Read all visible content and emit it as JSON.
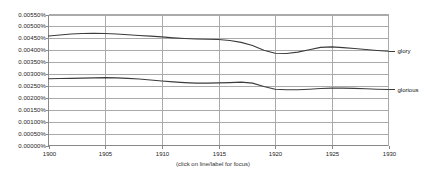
{
  "caption": "(click on line/label for focus)",
  "axes": {
    "y_ticks": [
      "0.00000%",
      "0.00050%",
      "0.00100%",
      "0.00150%",
      "0.00200%",
      "0.00250%",
      "0.00300%",
      "0.00350%",
      "0.00400%",
      "0.00450%",
      "0.00500%",
      "0.00550%"
    ],
    "x_ticks": [
      "1900",
      "1905",
      "1910",
      "1915",
      "1920",
      "1925",
      "1930"
    ],
    "ylim": [
      0,
      0.0055
    ],
    "xlim": [
      1900,
      1930
    ]
  },
  "colors": {
    "line": "#3c3c3c",
    "grid": "#aaaaaa",
    "axis": "#888888",
    "text": "#222222",
    "background": "#ffffff"
  },
  "chart_data": {
    "type": "line",
    "title": "",
    "xlabel": "",
    "ylabel": "",
    "xlim": [
      1900,
      1930
    ],
    "ylim": [
      0,
      0.0055
    ],
    "grid": true,
    "legend_position": "right-inline",
    "annotations": [
      "(click on line/label for focus)"
    ],
    "x": [
      1900,
      1901,
      1902,
      1903,
      1904,
      1905,
      1906,
      1907,
      1908,
      1909,
      1910,
      1911,
      1912,
      1913,
      1914,
      1915,
      1916,
      1917,
      1918,
      1919,
      1920,
      1921,
      1922,
      1923,
      1924,
      1925,
      1926,
      1927,
      1928,
      1929,
      1930
    ],
    "series": [
      {
        "name": "glory",
        "values": [
          0.0046,
          0.00464,
          0.00468,
          0.0047,
          0.00471,
          0.0047,
          0.00468,
          0.00465,
          0.00462,
          0.00459,
          0.00456,
          0.00452,
          0.00449,
          0.00447,
          0.00446,
          0.00445,
          0.00441,
          0.00433,
          0.0042,
          0.004,
          0.00387,
          0.00386,
          0.00392,
          0.00402,
          0.00412,
          0.00414,
          0.00411,
          0.00407,
          0.00403,
          0.00399,
          0.00396
        ]
      },
      {
        "name": "glorious",
        "values": [
          0.0028,
          0.00281,
          0.00282,
          0.00283,
          0.00284,
          0.00285,
          0.00284,
          0.00282,
          0.00279,
          0.00275,
          0.00271,
          0.00267,
          0.00264,
          0.00262,
          0.00262,
          0.00263,
          0.00264,
          0.00266,
          0.00262,
          0.00248,
          0.00236,
          0.00234,
          0.00234,
          0.00236,
          0.00239,
          0.00241,
          0.00241,
          0.0024,
          0.00238,
          0.00236,
          0.00235
        ]
      }
    ]
  },
  "series_labels": [
    {
      "name": "glory",
      "text": "glory"
    },
    {
      "name": "glorious",
      "text": "glorious"
    }
  ]
}
